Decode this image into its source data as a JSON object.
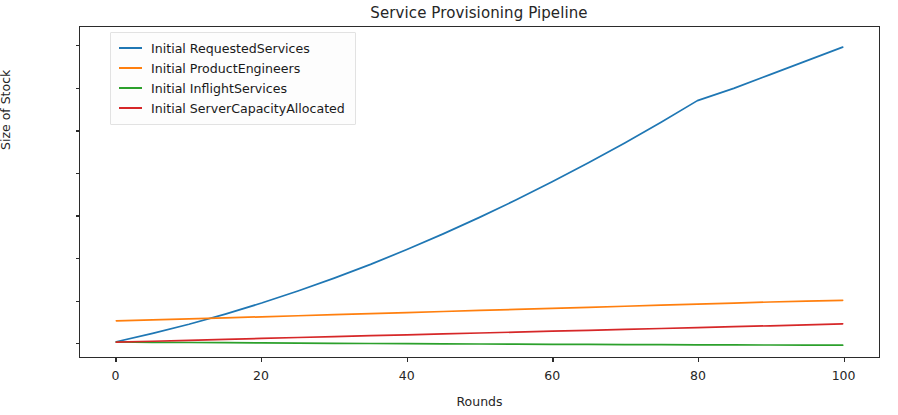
{
  "chart_data": {
    "type": "line",
    "title": "Service Provisioning Pipeline",
    "xlabel": "Rounds",
    "ylabel": "Size of Stock",
    "xlim": [
      -5,
      105
    ],
    "ylim": [
      -700,
      14900
    ],
    "xticks": [
      0,
      20,
      40,
      60,
      80,
      100
    ],
    "yticks": [
      0,
      2000,
      4000,
      6000,
      8000,
      10000,
      12000,
      14000
    ],
    "grid": false,
    "legend_position": "upper left",
    "x": [
      0,
      5,
      10,
      15,
      20,
      25,
      30,
      35,
      40,
      45,
      50,
      55,
      60,
      65,
      70,
      75,
      80,
      85,
      90,
      95,
      100
    ],
    "series": [
      {
        "name": "Initial RequestedServices",
        "color": "#1f77b4",
        "values": [
          20,
          420,
          850,
          1330,
          1850,
          2420,
          3030,
          3680,
          4380,
          5120,
          5900,
          6720,
          7580,
          8480,
          9420,
          10400,
          11420,
          12000,
          12650,
          13300,
          13950
        ]
      },
      {
        "name": "Initial ProductEngineers",
        "color": "#ff7f0e",
        "values": [
          1010,
          1055,
          1100,
          1150,
          1200,
          1250,
          1300,
          1350,
          1400,
          1450,
          1500,
          1550,
          1600,
          1650,
          1700,
          1750,
          1800,
          1850,
          1900,
          1940,
          1980
        ]
      },
      {
        "name": "Initial InflightServices",
        "color": "#2ca02c",
        "values": [
          10,
          -5,
          -15,
          -25,
          -35,
          -45,
          -55,
          -62,
          -70,
          -78,
          -85,
          -92,
          -100,
          -106,
          -112,
          -118,
          -124,
          -129,
          -133,
          -137,
          -140
        ]
      },
      {
        "name": "Initial ServerCapacityAllocated",
        "color": "#d62728",
        "values": [
          0,
          45,
          90,
          135,
          180,
          222,
          265,
          308,
          350,
          392,
          435,
          478,
          520,
          563,
          606,
          648,
          690,
          733,
          776,
          820,
          870
        ]
      }
    ]
  },
  "axis": {
    "y_tick_labels": [
      "0",
      "2000",
      "4000",
      "6000",
      "8000",
      "10000",
      "12000",
      "14000"
    ],
    "x_tick_labels": [
      "0",
      "20",
      "40",
      "60",
      "80",
      "100"
    ]
  }
}
